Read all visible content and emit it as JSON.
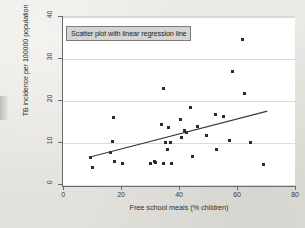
{
  "figure": {
    "background_color": "#e9e8e4",
    "plot_background_color": "#ffffff",
    "point_color": "#2b2b2b",
    "line_color": "#3a3a3a",
    "annotation_label": "Scatter plot with linear regression line"
  },
  "chart_data": {
    "type": "scatter",
    "title": "",
    "annotation": "Scatter plot with linear regression line",
    "xlabel": "Free school meals (% children)",
    "ylabel": "TB incidence per 100000 population",
    "xlim": [
      0,
      80
    ],
    "ylim": [
      0,
      40
    ],
    "xticks": [
      0,
      20,
      40,
      60,
      80
    ],
    "yticks": [
      0,
      10,
      20,
      30,
      40
    ],
    "xtick_labels": [
      "0",
      "20",
      "40",
      "60",
      "80"
    ],
    "ytick_labels": [
      "0",
      "10",
      "20",
      "30",
      "40"
    ],
    "grid": "horizontal",
    "legend": "none",
    "points": [
      {
        "x": 9.5,
        "y": 6.5
      },
      {
        "x": 10.0,
        "y": 4.2
      },
      {
        "x": 16.5,
        "y": 7.7
      },
      {
        "x": 17.5,
        "y": 16.0
      },
      {
        "x": 17.0,
        "y": 10.3
      },
      {
        "x": 17.8,
        "y": 5.6
      },
      {
        "x": 20.5,
        "y": 5.2
      },
      {
        "x": 30.0,
        "y": 5.2
      },
      {
        "x": 31.5,
        "y": 5.5
      },
      {
        "x": 32.0,
        "y": 5.3
      },
      {
        "x": 34.5,
        "y": 23.0
      },
      {
        "x": 34.0,
        "y": 14.5
      },
      {
        "x": 34.5,
        "y": 5.2
      },
      {
        "x": 35.5,
        "y": 10.2
      },
      {
        "x": 36.0,
        "y": 8.5
      },
      {
        "x": 36.5,
        "y": 13.7
      },
      {
        "x": 37.0,
        "y": 10.2
      },
      {
        "x": 37.5,
        "y": 5.2
      },
      {
        "x": 40.5,
        "y": 15.5
      },
      {
        "x": 41.0,
        "y": 11.3
      },
      {
        "x": 42.0,
        "y": 13.0
      },
      {
        "x": 42.5,
        "y": 12.6
      },
      {
        "x": 44.0,
        "y": 18.5
      },
      {
        "x": 44.5,
        "y": 6.9
      },
      {
        "x": 46.5,
        "y": 13.9
      },
      {
        "x": 49.5,
        "y": 11.9
      },
      {
        "x": 52.5,
        "y": 16.7
      },
      {
        "x": 53.0,
        "y": 8.4
      },
      {
        "x": 55.5,
        "y": 16.4
      },
      {
        "x": 57.5,
        "y": 10.6
      },
      {
        "x": 58.5,
        "y": 27.0
      },
      {
        "x": 62.0,
        "y": 34.7
      },
      {
        "x": 62.5,
        "y": 21.7
      },
      {
        "x": 64.5,
        "y": 10.2
      },
      {
        "x": 69.0,
        "y": 5.0
      }
    ],
    "regression_line": {
      "x_start": 9.0,
      "y_start": 6.6,
      "x_end": 70.5,
      "y_end": 17.6,
      "label": "linear regression line"
    }
  }
}
